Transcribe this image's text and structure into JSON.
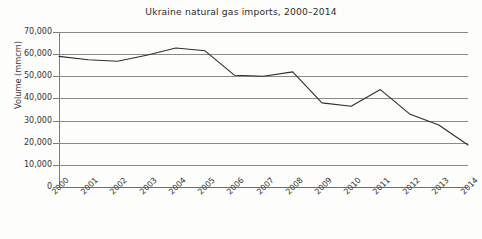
{
  "chart_data": {
    "type": "line",
    "title": "Ukraine natural gas imports, 2000–2014",
    "xlabel": "",
    "ylabel": "Volume (mmcm)",
    "categories": [
      "2000",
      "2001",
      "2002",
      "2003",
      "2004",
      "2005",
      "2006",
      "2007",
      "2008",
      "2009",
      "2010",
      "2011",
      "2012",
      "2013",
      "2014"
    ],
    "values": [
      59000,
      57500,
      56800,
      59500,
      62800,
      61500,
      50500,
      50000,
      52000,
      38000,
      36500,
      44000,
      33000,
      28000,
      19000
    ],
    "series": [
      {
        "name": "Volume (mmcm)",
        "color": "#2e2e2e",
        "values": [
          59000,
          57500,
          56800,
          59500,
          62800,
          61500,
          50500,
          50000,
          52000,
          38000,
          36500,
          44000,
          33000,
          28000,
          19000
        ]
      }
    ],
    "ylim": [
      0,
      70000
    ],
    "yticks": [
      0,
      10000,
      20000,
      30000,
      40000,
      50000,
      60000,
      70000
    ],
    "ytick_labels": [
      "0",
      "10,000",
      "20,000",
      "30,000",
      "40,000",
      "50,000",
      "60,000",
      "70,000"
    ],
    "grid": true,
    "legend": false,
    "legend_position": "none",
    "xtick_rotation": -45
  }
}
